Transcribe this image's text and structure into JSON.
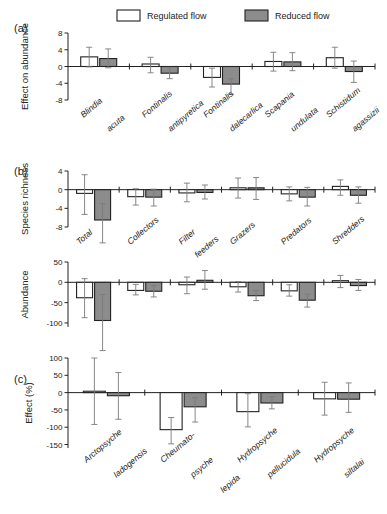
{
  "figure": {
    "legend": {
      "items": [
        {
          "label": "Regulated flow",
          "style": "open",
          "color": "#ffffff"
        },
        {
          "label": "Reduced flow",
          "style": "filled",
          "color": "#8c8c8c"
        }
      ]
    },
    "panels": [
      {
        "letter": "(a)"
      },
      {
        "letter": "(b)"
      },
      {
        "letter": "(c)"
      }
    ]
  },
  "chart_data": [
    {
      "type": "bar",
      "panel": "(a)",
      "title": "",
      "ylabel": "Effect on abundance",
      "xlabel": "",
      "ylim": [
        -8,
        8
      ],
      "yticks": [
        -8,
        -4,
        0,
        4,
        8
      ],
      "ytick_labels": [
        "-8",
        "-4",
        "0",
        "4",
        "8"
      ],
      "grid": false,
      "legend_position": "top",
      "categories": [
        "Blindia acuta",
        "Fontinalis antipyretica",
        "Fontinalis dalecarlica",
        "Scapania undulata",
        "Schistidum agassizii"
      ],
      "category_lines": [
        [
          "Blindia",
          "acuta"
        ],
        [
          "Fontinalis",
          "antipyretica"
        ],
        [
          "Fontinalis",
          "dalecarlica"
        ],
        [
          "Scapania",
          "undulata"
        ],
        [
          "Schistidum",
          "agassizii"
        ]
      ],
      "series": [
        {
          "name": "Regulated flow",
          "style": "open",
          "values": [
            2.3,
            0.6,
            -2.6,
            1.2,
            2.1
          ],
          "err_low": [
            -0.1,
            -1.5,
            -4.9,
            -1.1,
            -0.4
          ],
          "err_high": [
            4.6,
            2.2,
            -0.4,
            3.4,
            4.6
          ]
        },
        {
          "name": "Reduced flow",
          "style": "filled",
          "values": [
            1.9,
            -1.6,
            -4.2,
            1.1,
            -1.2
          ],
          "err_low": [
            -0.3,
            -2.9,
            -6.6,
            -1.0,
            -3.8
          ],
          "err_high": [
            4.2,
            -0.2,
            -2.9,
            3.3,
            1.3
          ]
        }
      ]
    },
    {
      "type": "bar",
      "panel": "(b-richness)",
      "title": "",
      "ylabel": "Species richness",
      "xlabel": "",
      "ylim": [
        -8,
        4
      ],
      "yticks": [
        -8,
        -4,
        0,
        4
      ],
      "ytick_labels": [
        "-8",
        "-4",
        "0",
        "4"
      ],
      "grid": false,
      "categories": [
        "Total",
        "Collectors",
        "Filter feeders",
        "Grazers",
        "Predators",
        "Shredders"
      ],
      "category_lines": [
        [
          "Total"
        ],
        [
          "Collectors"
        ],
        [
          "Filter",
          "feeders"
        ],
        [
          "Grazers"
        ],
        [
          "Predators"
        ],
        [
          "Shredders"
        ]
      ],
      "series": [
        {
          "name": "Regulated flow",
          "style": "open",
          "values": [
            -0.8,
            -1.5,
            -0.7,
            0.4,
            -0.9,
            0.7
          ],
          "err_low": [
            -5.3,
            -3.3,
            -2.6,
            -1.8,
            -2.4,
            -1.2
          ],
          "err_high": [
            3.2,
            0.2,
            1.4,
            2.5,
            0.6,
            2.1
          ]
        },
        {
          "name": "Reduced flow",
          "style": "filled",
          "values": [
            -6.5,
            -1.6,
            -0.6,
            0.4,
            -1.6,
            -1.2
          ],
          "err_low": [
            -11.4,
            -3.5,
            -2.0,
            -2.1,
            -3.5,
            -2.9
          ],
          "err_high": [
            -3.0,
            0.1,
            1.0,
            2.6,
            0.5,
            0.6
          ]
        }
      ]
    },
    {
      "type": "bar",
      "panel": "(b-abundance)",
      "title": "",
      "ylabel": "Abundance",
      "xlabel": "",
      "ylim": [
        -110,
        50
      ],
      "yticks": [
        -100,
        -50,
        0,
        50
      ],
      "ytick_labels": [
        "-100",
        "-50",
        "0",
        "50"
      ],
      "grid": false,
      "categories": [
        "Total",
        "Collectors",
        "Filter feeders",
        "Grazers",
        "Predators",
        "Shredders"
      ],
      "series": [
        {
          "name": "Regulated flow",
          "style": "open",
          "values": [
            -38,
            -20,
            -6,
            -11,
            -21,
            4
          ],
          "err_low": [
            -87,
            -31,
            -28,
            -24,
            -34,
            -13
          ],
          "err_high": [
            9,
            -5,
            13,
            2,
            -6,
            17
          ]
        },
        {
          "name": "Reduced flow",
          "style": "filled",
          "values": [
            -94,
            -22,
            5,
            -33,
            -44,
            -8
          ],
          "err_low": [
            -168,
            -36,
            -17,
            -45,
            -61,
            -20
          ],
          "err_high": [
            -30,
            -8,
            29,
            -20,
            -29,
            7
          ]
        }
      ]
    },
    {
      "type": "bar",
      "panel": "(c)",
      "title": "",
      "ylabel": "Effect (%)",
      "xlabel": "",
      "ylim": [
        -160,
        100
      ],
      "yticks": [
        -150,
        -100,
        -50,
        0,
        50,
        100
      ],
      "ytick_labels": [
        "-150",
        "-100",
        "-50",
        "0",
        "50",
        "100"
      ],
      "grid": false,
      "categories": [
        "Arctopsyche ladogensis",
        "Cheumatopsyche lepida",
        "Hydropsyche pellucidula",
        "Hydropsyche siltalai"
      ],
      "category_lines": [
        [
          "Arctopsyche",
          "ladogensis"
        ],
        [
          "Cheumato-",
          "psyche",
          "lepida"
        ],
        [
          "Hydropsyche",
          "pellucidula"
        ],
        [
          "Hydropsyche",
          "siltalai"
        ]
      ],
      "series": [
        {
          "name": "Regulated flow",
          "style": "open",
          "values": [
            4,
            -107,
            -55,
            -18
          ],
          "err_low": [
            -92,
            -148,
            -99,
            -65
          ],
          "err_high": [
            100,
            -72,
            -3,
            30
          ]
        },
        {
          "name": "Reduced flow",
          "style": "filled",
          "values": [
            -9,
            -41,
            -30,
            -19
          ],
          "err_low": [
            -77,
            -85,
            -47,
            -57
          ],
          "err_high": [
            58,
            -15,
            -12,
            28
          ]
        }
      ]
    }
  ]
}
